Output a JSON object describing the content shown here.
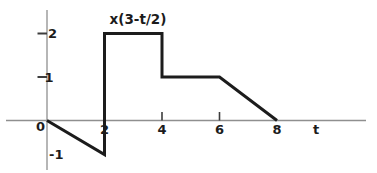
{
  "figure": {
    "background": "#ffffff"
  },
  "chart_data": {
    "type": "line",
    "title": "x(3-t/2)",
    "xlabel": "t",
    "ylabel": "",
    "xlim": [
      -1.4,
      11.1
    ],
    "ylim": [
      -1.5,
      2.5
    ],
    "grid": false,
    "legend": "none",
    "points": [
      {
        "t": 0,
        "v": 0
      },
      {
        "t": 2,
        "v": -1
      },
      {
        "t": 2,
        "v": 2
      },
      {
        "t": 4,
        "v": 2
      },
      {
        "t": 4,
        "v": 1
      },
      {
        "t": 6,
        "v": 1
      },
      {
        "t": 8,
        "v": 0
      }
    ],
    "x_tick_labels": [
      {
        "value": 0,
        "label": "0"
      },
      {
        "value": 2,
        "label": "2"
      },
      {
        "value": 4,
        "label": "4"
      },
      {
        "value": 6,
        "label": "6"
      },
      {
        "value": 8,
        "label": "8"
      }
    ],
    "x_dash_ticks": [
      4,
      6
    ],
    "y_tick_labels": [
      {
        "value": 2,
        "label": "2"
      },
      {
        "value": 1,
        "label": "1"
      },
      {
        "value": -1,
        "label": "-1"
      }
    ],
    "y_dash_ticks": [
      2,
      1
    ],
    "colors": {
      "curve": "#1c1c1c",
      "axis": "#8f8f8f",
      "tick": "#3d3d3d",
      "text": "#1c1c1c",
      "background": "#ffffff"
    }
  }
}
